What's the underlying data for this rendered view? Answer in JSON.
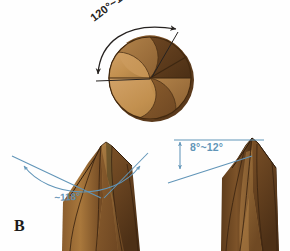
{
  "figure": {
    "panel_label": "B",
    "background_color": "#fefefe",
    "annotation_color_top": "#262220",
    "annotation_color_bottom": "#6195b8",
    "metal_light": "#c9975c",
    "metal_mid": "#a4753f",
    "metal_dark": "#7a4f28",
    "metal_darkest": "#5c3a1c",
    "outline_color": "#3a2612"
  },
  "views": {
    "end_view": {
      "name": "drill-point-end-view",
      "angle_label": "120°~135°",
      "description": "point angle"
    },
    "side_view_left": {
      "name": "drill-point-side-view",
      "angle_label": "~118°",
      "description": "included point angle"
    },
    "side_view_right": {
      "name": "drill-chisel-edge-view",
      "angle_label": "8°~12°",
      "description": "chisel edge / lip clearance angle"
    }
  },
  "icons": {
    "arrow_head": "arrowhead-icon",
    "arc": "angle-arc-icon",
    "dimension_line": "dimension-line-icon"
  }
}
